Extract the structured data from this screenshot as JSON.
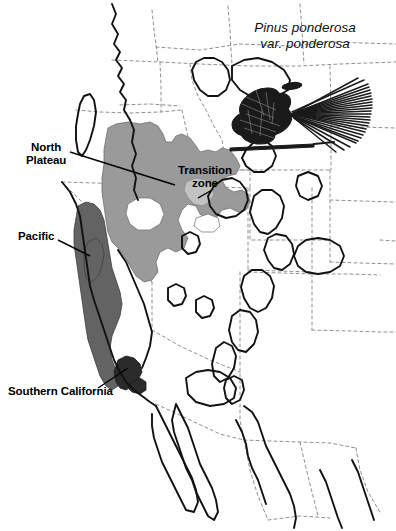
{
  "figure": {
    "title_line1": "Pinus ponderosa",
    "title_line2": "var. ponderosa",
    "illustration": "pine-cone-and-needles"
  },
  "labels": {
    "north_plateau": "North\nPlateau",
    "pacific": "Pacific",
    "transition_zone": "Transition\nzone",
    "southern_california": "Southern California"
  },
  "colors": {
    "background": "#ffffff",
    "range_outline": "#111111",
    "state_border": "#8a8a8a",
    "region_north_plateau": "#9a9a9a",
    "region_pacific": "#636363",
    "region_transition": "#c2c2c2",
    "illustration_ink": "#1a1a1a",
    "label_text": "#000000"
  },
  "map": {
    "regions": [
      {
        "name": "North Plateau",
        "shade": "medium-gray"
      },
      {
        "name": "Pacific",
        "shade": "dark-gray"
      },
      {
        "name": "Transition zone",
        "shade": "light-gray"
      },
      {
        "name": "Southern California",
        "shade": "dark-gray"
      }
    ],
    "line_styles": {
      "species_range": "solid-thick-black",
      "political_border": "dashed-thin-gray"
    },
    "extent": "Western North America: British Columbia to northern Mexico, Pacific coast to Great Plains"
  }
}
